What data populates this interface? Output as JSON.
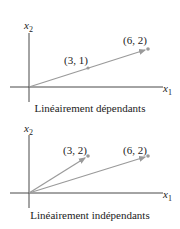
{
  "panels": [
    {
      "caption": "Linéairement dépendants",
      "x_axis": "x",
      "x_sub": "1",
      "y_axis": "x",
      "y_sub": "2",
      "points": [
        {
          "label": "(3, 1)",
          "x": 3,
          "y": 1
        },
        {
          "label": "(6, 2)",
          "x": 6,
          "y": 2
        }
      ]
    },
    {
      "caption": "Linéairement indépendants",
      "x_axis": "x",
      "x_sub": "1",
      "y_axis": "x",
      "y_sub": "2",
      "points": [
        {
          "label": "(3, 2)",
          "x": 3,
          "y": 2
        },
        {
          "label": "(6, 2)",
          "x": 6,
          "y": 2
        }
      ]
    }
  ],
  "colors": {
    "vector": "#9a9a9a",
    "axis": "#333333",
    "text": "#222222"
  }
}
